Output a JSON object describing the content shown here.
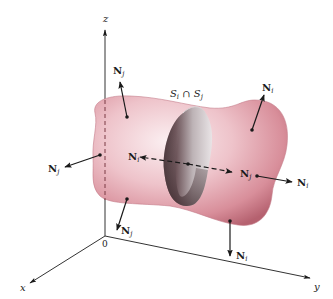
{
  "figure": {
    "type": "3D surface diagram",
    "intersection_label": {
      "base": "S",
      "sub1": "i",
      "op": " ∩ ",
      "sub2": "j"
    },
    "axes": {
      "x_label": "x",
      "y_label": "y",
      "z_label": "z",
      "origin_label": "0"
    },
    "normals": [
      {
        "id": "top-left",
        "base": "N",
        "sub": "j"
      },
      {
        "id": "top-right",
        "base": "N",
        "sub": "i"
      },
      {
        "id": "left",
        "base": "N",
        "sub": "j"
      },
      {
        "id": "center-left",
        "base": "N",
        "sub": "i"
      },
      {
        "id": "center-right",
        "base": "N",
        "sub": "j"
      },
      {
        "id": "right",
        "base": "N",
        "sub": "i"
      },
      {
        "id": "bottom-left",
        "base": "N",
        "sub": "j"
      },
      {
        "id": "bottom-right",
        "base": "N",
        "sub": "i"
      }
    ],
    "colors": {
      "surface_light": "#f6dde2",
      "surface_mid": "#e4a7b1",
      "surface_dark": "#b5616f",
      "cut_light": "#d9d4d6",
      "cut_dark": "#4a3438",
      "ink": "#1a1a1a"
    }
  }
}
